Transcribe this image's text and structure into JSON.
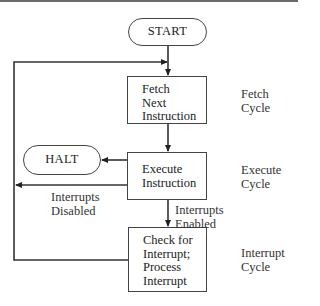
{
  "diagram": {
    "type": "flowchart",
    "nodes": {
      "start": {
        "label": "START",
        "shape": "terminal"
      },
      "fetch": {
        "lines": [
          "Fetch",
          "Next",
          "Instruction"
        ],
        "shape": "process"
      },
      "execute": {
        "lines": [
          "Execute",
          "Instruction"
        ],
        "shape": "process"
      },
      "halt": {
        "label": "HALT",
        "shape": "terminal"
      },
      "interrupt": {
        "lines": [
          "Check for",
          "Interrupt;",
          "Process",
          "Interrupt"
        ],
        "shape": "process"
      }
    },
    "edge_labels": {
      "disabled": [
        "Interrupts",
        "Disabled"
      ],
      "enabled": [
        "Interrupts",
        "Enabled"
      ]
    },
    "cycle_labels": {
      "fetch": [
        "Fetch",
        "Cycle"
      ],
      "execute": [
        "Execute",
        "Cycle"
      ],
      "interrupt": [
        "Interrupt",
        "Cycle"
      ]
    },
    "edges": [
      {
        "from": "START",
        "to": "Fetch Next Instruction"
      },
      {
        "from": "Fetch Next Instruction",
        "to": "Execute Instruction"
      },
      {
        "from": "Execute Instruction",
        "to": "HALT"
      },
      {
        "from": "Execute Instruction",
        "to": "Fetch Next Instruction",
        "label": "Interrupts Disabled"
      },
      {
        "from": "Execute Instruction",
        "to": "Check for Interrupt; Process Interrupt",
        "label": "Interrupts Enabled"
      },
      {
        "from": "Check for Interrupt; Process Interrupt",
        "to": "Fetch Next Instruction"
      }
    ],
    "colors": {
      "line": "#333333",
      "background": "#ffffff",
      "text": "#222222"
    }
  }
}
